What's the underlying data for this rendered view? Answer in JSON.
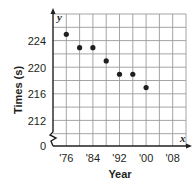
{
  "chart_data": {
    "type": "scatter",
    "title": "",
    "xlabel": "Year",
    "ylabel": "Times (s)",
    "x_axis_variable": "x",
    "y_axis_variable": "y",
    "x_tick_labels": [
      "'76",
      "'84",
      "'92",
      "'00",
      "'08"
    ],
    "x_tick_values": [
      1976,
      1984,
      1992,
      2000,
      2008
    ],
    "y_tick_labels": [
      "0",
      "212",
      "216",
      "220",
      "224"
    ],
    "y_tick_values": [
      0,
      212,
      216,
      220,
      224
    ],
    "xlim": [
      1972,
      2012
    ],
    "ylim": [
      208,
      228
    ],
    "y_axis_break": true,
    "grid": true,
    "legend": null,
    "points": [
      {
        "x": 1976,
        "y": 225
      },
      {
        "x": 1980,
        "y": 223
      },
      {
        "x": 1984,
        "y": 223
      },
      {
        "x": 1988,
        "y": 221
      },
      {
        "x": 1992,
        "y": 219
      },
      {
        "x": 1996,
        "y": 219
      },
      {
        "x": 2000,
        "y": 217
      }
    ],
    "colors": {
      "axis": "#231f20",
      "grid": "#9a9a9a",
      "point": "#231f20"
    }
  }
}
